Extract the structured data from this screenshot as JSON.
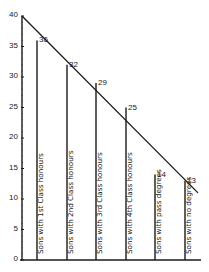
{
  "chart_data": {
    "type": "bar",
    "title": "",
    "xlabel": "",
    "ylabel": "",
    "ylim": [
      0,
      40
    ],
    "yticks": [
      0,
      5,
      10,
      15,
      20,
      25,
      30,
      35,
      40
    ],
    "grid": false,
    "legend": null,
    "categories": [
      "Sons with 1st Class honours",
      "Sons with 2nd Class honours",
      "Sons with 3rd Class honours",
      "Sons with 4th Class honours",
      "Sons with pass degrees",
      "Sons with no degrees"
    ],
    "values": [
      36,
      32,
      29,
      25,
      14,
      13
    ],
    "value_labels": [
      "36",
      "32",
      "29",
      "25",
      "14",
      "13"
    ],
    "trend_line": {
      "start": {
        "x": "axis",
        "y": 40
      },
      "end": {
        "x": "after last bar",
        "y": 11
      },
      "style": "straight diagonal"
    },
    "colors": {
      "ink": "#1a1a1a",
      "background": "#ffffff"
    }
  }
}
